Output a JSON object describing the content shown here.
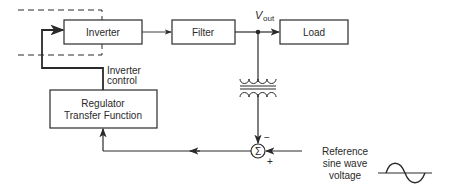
{
  "diagram": {
    "blocks": {
      "inverter": "Inverter",
      "filter": "Filter",
      "load": "Load",
      "regulator_line1": "Regulator",
      "regulator_line2": "Transfer Function"
    },
    "labels": {
      "vout_main": "V",
      "vout_sub": "out",
      "inverter_control_line1": "Inverter",
      "inverter_control_line2": "control",
      "summing_symbol": "Σ",
      "minus_sign": "−",
      "plus_sign": "+",
      "reference_line1": "Reference",
      "reference_line2": "sine wave",
      "reference_line3": "voltage"
    },
    "colors": {
      "stroke": "#2a2a2a",
      "background": "#ffffff"
    }
  }
}
